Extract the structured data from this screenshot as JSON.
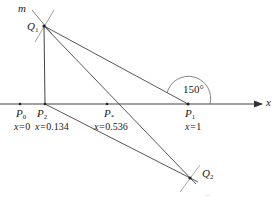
{
  "diagram": {
    "axis": {
      "label": "x"
    },
    "line_label": "m",
    "angle_label": "150°",
    "points": {
      "P0": {
        "name": "P",
        "sub": "0",
        "value": "0"
      },
      "P2": {
        "name": "P",
        "sub": "2",
        "value": "0.134"
      },
      "Pstar": {
        "name": "P",
        "sub": "*",
        "value": "0.536"
      },
      "P1": {
        "name": "P",
        "sub": "1",
        "value": "1"
      },
      "Q1": {
        "name": "Q",
        "sub": "1"
      },
      "Q2": {
        "name": "Q",
        "sub": "2"
      }
    },
    "value_prefix": "x=",
    "caption_fragment": "..."
  },
  "colors": {
    "line": "#444444",
    "text": "#222222",
    "background": "#ffffff"
  }
}
